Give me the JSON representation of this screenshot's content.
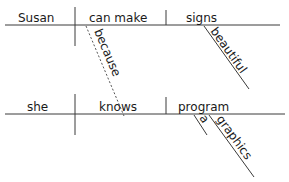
{
  "diagram": {
    "type": "sentence-diagram",
    "sentence": "Susan can make beautiful signs because she knows a graphics program",
    "main_clause": {
      "subject": "Susan",
      "verb": "can make",
      "object": "signs",
      "modifiers": [
        {
          "word": "beautiful",
          "modifies": "signs"
        }
      ]
    },
    "connector": {
      "word": "because",
      "style": "dashed",
      "links": [
        "can make",
        "knows"
      ]
    },
    "subordinate_clause": {
      "subject": "she",
      "verb": "knows",
      "object": "program",
      "modifiers": [
        {
          "word": "a",
          "modifies": "program"
        },
        {
          "word": "graphics",
          "modifies": "program"
        }
      ]
    }
  }
}
